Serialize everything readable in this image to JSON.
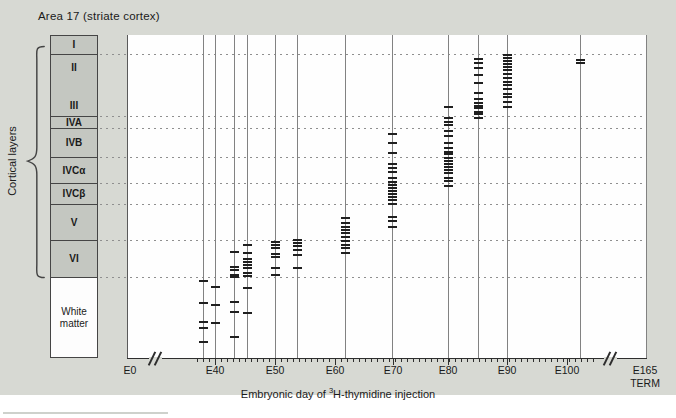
{
  "figure": {
    "title": "Area 17 (striate cortex)",
    "side_label": "Cortical layers",
    "axis_title": {
      "pre": "Embryonic day of ",
      "sup": "3",
      "post": "H-thymidine injection"
    }
  },
  "colors": {
    "page_bg": "#ffffff",
    "panel_bg": "#d7d9d3",
    "plot_bg": "#fefefe",
    "layer_box_fill": "#c4c7c1",
    "layer_box_border": "#454545",
    "grid_line": "#828282",
    "dotted_line": "#8f8f8f",
    "data_tick": "#1f1f1f",
    "axis": "#2e2e2e",
    "text": "#1a1a1a"
  },
  "chart_data": {
    "type": "scatter",
    "title": "Area 17 (striate cortex)",
    "xlabel": "Embryonic day of ³H-thymidine injection",
    "ylabel": "Cortical layers",
    "legend": "none",
    "grid": "horizontal dotted lines at cortical layer boundaries; one vertical line per injection day; each short horizontal dash = labeled neuron position",
    "x_axis_labels": [
      "E0",
      "E40",
      "E50",
      "E60",
      "E70",
      "E80",
      "E90",
      "E100",
      "E165 TERM"
    ],
    "layers": [
      {
        "labels": [
          "I"
        ],
        "top": 35,
        "bottom": 54,
        "fill": "gray"
      },
      {
        "labels": [
          "II",
          "III"
        ],
        "top": 54,
        "bottom": 116,
        "fill": "gray"
      },
      {
        "labels": [
          "IVA"
        ],
        "top": 116,
        "bottom": 128,
        "fill": "gray"
      },
      {
        "labels": [
          "IVB"
        ],
        "top": 128,
        "bottom": 157,
        "fill": "gray"
      },
      {
        "labels": [
          "IVCα"
        ],
        "top": 157,
        "bottom": 183,
        "fill": "gray"
      },
      {
        "labels": [
          "IVCβ"
        ],
        "top": 183,
        "bottom": 204,
        "fill": "gray"
      },
      {
        "labels": [
          "V"
        ],
        "top": 204,
        "bottom": 240,
        "fill": "gray"
      },
      {
        "labels": [
          "VI"
        ],
        "top": 240,
        "bottom": 277,
        "fill": "gray"
      },
      {
        "labels": [
          "White matter"
        ],
        "top": 277,
        "bottom": 357,
        "fill": "white"
      }
    ],
    "injections": [
      {
        "day": "E38",
        "x": 203,
        "cell_layers": "white matter",
        "tick_y": [
          281,
          303,
          322,
          328,
          342
        ]
      },
      {
        "day": "E40",
        "x": 215,
        "cell_layers": "white matter",
        "tick_y": [
          287,
          305,
          323
        ]
      },
      {
        "day": "E43",
        "x": 234,
        "cell_layers": "VI, white matter",
        "tick_y": [
          252,
          267,
          270,
          275,
          277,
          302,
          312,
          337
        ]
      },
      {
        "day": "E45",
        "x": 247,
        "cell_layers": "VI, white matter",
        "tick_y": [
          245,
          253,
          259,
          262,
          265,
          268,
          273,
          276,
          288,
          313
        ]
      },
      {
        "day": "E50",
        "x": 275,
        "cell_layers": "VI",
        "tick_y": [
          242,
          245,
          248,
          254,
          257,
          268,
          275
        ]
      },
      {
        "day": "E54",
        "x": 297,
        "cell_layers": "VI",
        "tick_y": [
          240,
          243,
          246,
          250,
          255,
          268
        ]
      },
      {
        "day": "E62",
        "x": 345,
        "cell_layers": "V, VI",
        "tick_y": [
          218,
          223,
          227,
          230,
          233,
          237,
          241,
          245,
          248,
          253
        ]
      },
      {
        "day": "E70",
        "x": 392,
        "cell_layers": "IVB, IVCα, IVCβ, V",
        "tick_y": [
          134,
          143,
          153,
          164,
          168,
          172,
          178,
          182,
          185,
          188,
          191,
          194,
          197,
          200,
          204,
          217,
          221,
          227
        ]
      },
      {
        "day": "E80",
        "x": 448,
        "cell_layers": "III, IVA, IVB, IVCα, IVCβ",
        "tick_y": [
          107,
          118,
          122,
          125,
          131,
          136,
          143,
          148,
          152,
          154,
          158,
          161,
          164,
          167,
          170,
          173,
          178,
          181,
          186
        ]
      },
      {
        "day": "E85",
        "x": 478,
        "cell_layers": "II/III, IVA",
        "tick_y": [
          59,
          63,
          68,
          75,
          83,
          93,
          99,
          103,
          106,
          108,
          112,
          114,
          118
        ]
      },
      {
        "day": "E90",
        "x": 507,
        "cell_layers": "II/III",
        "tick_y": [
          55,
          58,
          61,
          64,
          67,
          70,
          74,
          78,
          82,
          85,
          89,
          94,
          97,
          102,
          107
        ]
      },
      {
        "day": "E102",
        "x": 580,
        "cell_layers": "II",
        "tick_y": [
          60,
          63
        ]
      },
      {
        "day": "E165",
        "x": 646,
        "cell_layers": "none (term)",
        "tick_y": []
      }
    ],
    "x_ticks": [
      {
        "label": "E0",
        "x": 130
      },
      {
        "label": "E40",
        "x": 215,
        "major": true
      },
      {
        "label": "E50",
        "x": 275,
        "major": true
      },
      {
        "label": "E60",
        "x": 335,
        "major": true
      },
      {
        "label": "E70",
        "x": 393,
        "major": true
      },
      {
        "label": "E80",
        "x": 448,
        "major": true
      },
      {
        "label": "E90",
        "x": 507,
        "major": true
      },
      {
        "label": "E100",
        "x": 567,
        "major": true
      },
      {
        "label": "E165",
        "sub": "TERM",
        "x": 645
      }
    ],
    "axis_breaks_x": [
      155,
      610
    ],
    "minor_ticks": {
      "start": 197,
      "end": 594,
      "step": 6
    },
    "plot": {
      "left": 127,
      "right": 647,
      "top": 35,
      "bottom": 358,
      "dotted_left": 100
    }
  }
}
